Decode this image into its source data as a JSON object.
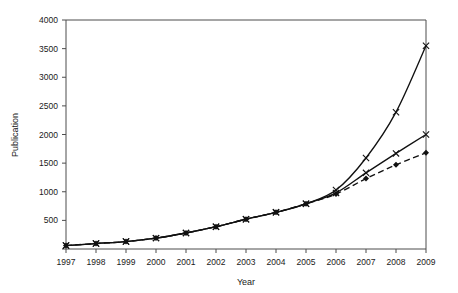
{
  "chart_data": {
    "type": "line",
    "title": "",
    "xlabel": "Year",
    "ylabel": "Publication",
    "x": [
      1997,
      1998,
      1999,
      2000,
      2001,
      2002,
      2003,
      2004,
      2005,
      2006,
      2007,
      2008,
      2009
    ],
    "xlim": [
      1997,
      2009
    ],
    "ylim": [
      0,
      4000
    ],
    "yticks": [
      0,
      500,
      1000,
      1500,
      2000,
      2500,
      3000,
      3500,
      4000
    ],
    "ytick_labels": [
      "",
      "500",
      "1000",
      "1500",
      "2000",
      "2500",
      "3000",
      "3500",
      "4000"
    ],
    "xtick_labels": [
      "1997",
      "1998",
      "1999",
      "2000",
      "2001",
      "2002",
      "2003",
      "2004",
      "2005",
      "2006",
      "2007",
      "2008",
      "2009"
    ],
    "grid": false,
    "legend": "none",
    "series": [
      {
        "name": "exponential-projection",
        "style": "solid",
        "marker": "cross",
        "values": [
          60,
          95,
          130,
          190,
          280,
          390,
          520,
          640,
          790,
          1030,
          1590,
          2390,
          3550
        ]
      },
      {
        "name": "linear-projection",
        "style": "solid",
        "marker": "cross",
        "values": [
          60,
          95,
          130,
          190,
          280,
          390,
          520,
          640,
          790,
          980,
          1330,
          1670,
          2000
        ]
      },
      {
        "name": "observed-publications",
        "style": "dashed",
        "marker": "diamond",
        "values": [
          60,
          95,
          130,
          190,
          280,
          390,
          520,
          640,
          790,
          960,
          1230,
          1470,
          1680
        ]
      }
    ]
  },
  "axes": {
    "y_title": "Publication",
    "x_title": "Year"
  }
}
